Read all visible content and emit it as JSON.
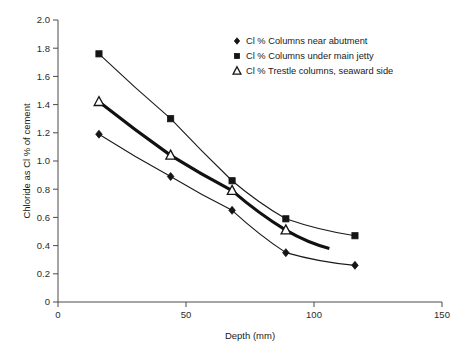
{
  "chart_data": {
    "type": "line",
    "title": "",
    "xlabel": "Depth (mm)",
    "ylabel": "Chloride as Cl % of cement",
    "xlim": [
      0,
      150
    ],
    "ylim": [
      0,
      2.0
    ],
    "xticks": [
      "0",
      "50",
      "100",
      "150"
    ],
    "xtick_values": [
      0,
      50,
      100,
      150
    ],
    "yticks": [
      "0",
      "0.2",
      "0.4",
      "0.6",
      "0.8",
      "1.0",
      "1.2",
      "1.4",
      "1.6",
      "1.8",
      "2.0"
    ],
    "ytick_values": [
      0,
      0.2,
      0.4,
      0.6,
      0.8,
      1.0,
      1.2,
      1.4,
      1.6,
      1.8,
      2.0
    ],
    "grid": false,
    "legend_position": "top-right",
    "series": [
      {
        "name": "Cl % Columns near abutment",
        "marker": "diamond",
        "line_weight": "thin",
        "x": [
          16,
          44,
          68,
          89,
          116
        ],
        "y": [
          1.19,
          0.89,
          0.65,
          0.35,
          0.26
        ]
      },
      {
        "name": "Cl % Columns under main jetty",
        "marker": "square",
        "line_weight": "thin",
        "x": [
          16,
          44,
          68,
          89,
          116
        ],
        "y": [
          1.76,
          1.3,
          0.86,
          0.59,
          0.47
        ]
      },
      {
        "name": "Cl % Trestle columns, seaward side",
        "marker": "triangle-open",
        "line_weight": "thick",
        "x": [
          16,
          44,
          68,
          89,
          106
        ],
        "y": [
          1.42,
          1.04,
          0.79,
          0.51,
          0.38
        ]
      }
    ]
  },
  "legend": {
    "entries": [
      {
        "marker": "diamond",
        "label": "Cl % Columns near abutment"
      },
      {
        "marker": "square",
        "label": "Cl % Columns under main jetty"
      },
      {
        "marker": "triangle-open",
        "label": "Cl % Trestle columns, seaward side"
      }
    ]
  },
  "colors": {
    "line": "#1a1a1a",
    "marker": "#151515",
    "axis": "#4a4a4a",
    "background": "#ffffff"
  }
}
